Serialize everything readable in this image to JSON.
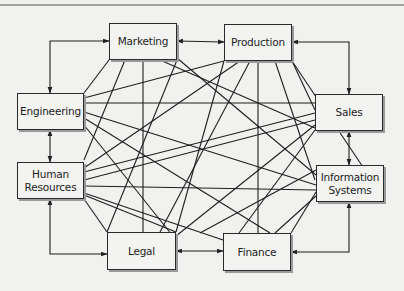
{
  "diagram": {
    "type": "full-mesh communication network",
    "colors": {
      "background": "#f1f1ef",
      "box_fill": "#f3f3f1",
      "line": "#1f1f1f",
      "shadow": "#9a9a9a"
    },
    "top_rule": {
      "y": 5
    },
    "nodes": [
      {
        "id": "marketing",
        "label": "Marketing",
        "x": 109,
        "y": 23,
        "w": 68,
        "h": 37
      },
      {
        "id": "production",
        "label": "Production",
        "x": 224,
        "y": 24,
        "w": 68,
        "h": 37
      },
      {
        "id": "engineering",
        "label": "Engineering",
        "x": 17,
        "y": 93,
        "w": 67,
        "h": 37
      },
      {
        "id": "sales",
        "label": "Sales",
        "x": 315,
        "y": 94,
        "w": 68,
        "h": 37
      },
      {
        "id": "hr",
        "label": "Human\nResources",
        "x": 17,
        "y": 162,
        "w": 67,
        "h": 37
      },
      {
        "id": "is",
        "label": "Information\nSystems",
        "x": 316,
        "y": 165,
        "w": 68,
        "h": 37
      },
      {
        "id": "legal",
        "label": "Legal",
        "x": 107,
        "y": 232,
        "w": 69,
        "h": 38
      },
      {
        "id": "finance",
        "label": "Finance",
        "x": 223,
        "y": 233,
        "w": 68,
        "h": 38
      }
    ],
    "arrows": [
      {
        "from": "marketing",
        "to": "production",
        "points": [
          [
            177,
            41
          ],
          [
            224,
            42
          ]
        ],
        "both": true
      },
      {
        "from": "engineering",
        "to": "marketing",
        "points": [
          [
            50,
            93
          ],
          [
            50,
            41
          ],
          [
            109,
            41
          ]
        ],
        "both": true
      },
      {
        "from": "production",
        "to": "sales",
        "points": [
          [
            292,
            42
          ],
          [
            349,
            42
          ],
          [
            349,
            94
          ]
        ],
        "both": true
      },
      {
        "from": "engineering",
        "to": "hr",
        "points": [
          [
            50,
            130
          ],
          [
            50,
            162
          ]
        ],
        "both": true
      },
      {
        "from": "sales",
        "to": "is",
        "points": [
          [
            349,
            131
          ],
          [
            349,
            165
          ]
        ],
        "both": true
      },
      {
        "from": "hr",
        "to": "legal",
        "points": [
          [
            50,
            199
          ],
          [
            50,
            254
          ],
          [
            107,
            254
          ]
        ],
        "both": true
      },
      {
        "from": "legal",
        "to": "finance",
        "points": [
          [
            176,
            251
          ],
          [
            223,
            251
          ]
        ],
        "both": true
      },
      {
        "from": "is",
        "to": "finance",
        "points": [
          [
            349,
            202
          ],
          [
            349,
            252
          ],
          [
            291,
            252
          ]
        ],
        "both": true
      }
    ],
    "lines": [
      [
        [
          109,
          60
        ],
        [
          84,
          93
        ]
      ],
      [
        [
          125,
          60
        ],
        [
          84,
          160
        ]
      ],
      [
        [
          143,
          60
        ],
        [
          143,
          232
        ]
      ],
      [
        [
          160,
          60
        ],
        [
          315,
          128
        ]
      ],
      [
        [
          177,
          58
        ],
        [
          316,
          175
        ]
      ],
      [
        [
          177,
          60
        ],
        [
          107,
          232
        ]
      ],
      [
        [
          224,
          61
        ],
        [
          84,
          98
        ]
      ],
      [
        [
          240,
          61
        ],
        [
          84,
          168
        ]
      ],
      [
        [
          250,
          61
        ],
        [
          160,
          232
        ]
      ],
      [
        [
          258,
          61
        ],
        [
          258,
          233
        ]
      ],
      [
        [
          275,
          61
        ],
        [
          315,
          180
        ]
      ],
      [
        [
          292,
          61
        ],
        [
          315,
          110
        ]
      ],
      [
        [
          224,
          61
        ],
        [
          176,
          232
        ]
      ],
      [
        [
          292,
          61
        ],
        [
          385,
          200
        ]
      ],
      [
        [
          84,
          103
        ],
        [
          315,
          103
        ]
      ],
      [
        [
          84,
          112
        ],
        [
          316,
          185
        ]
      ],
      [
        [
          84,
          118
        ],
        [
          270,
          233
        ]
      ],
      [
        [
          84,
          125
        ],
        [
          176,
          240
        ]
      ],
      [
        [
          84,
          172
        ],
        [
          315,
          113
        ]
      ],
      [
        [
          84,
          186
        ],
        [
          316,
          190
        ]
      ],
      [
        [
          84,
          193
        ],
        [
          223,
          240
        ]
      ],
      [
        [
          84,
          180
        ],
        [
          315,
          120
        ]
      ],
      [
        [
          84,
          195
        ],
        [
          176,
          232
        ]
      ],
      [
        [
          107,
          232
        ],
        [
          84,
          199
        ]
      ],
      [
        [
          315,
          125
        ],
        [
          176,
          236
        ]
      ],
      [
        [
          316,
          192
        ],
        [
          291,
          233
        ]
      ],
      [
        [
          316,
          170
        ],
        [
          200,
          233
        ]
      ],
      [
        [
          316,
          196
        ],
        [
          275,
          233
        ]
      ],
      [
        [
          315,
          130
        ],
        [
          239,
          233
        ]
      ]
    ]
  }
}
